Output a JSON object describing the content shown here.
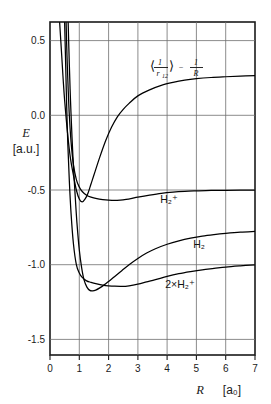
{
  "chart_data": {
    "type": "line",
    "title": "",
    "xlabel": "R",
    "xunit": "[a₀]",
    "ylabel": "E",
    "yunit": "[a.u.]",
    "xlim": [
      0,
      7
    ],
    "ylim": [
      -1.6,
      0.62
    ],
    "grid": true,
    "legend_position": "inline-labels",
    "xticks": [
      "0",
      "1",
      "2",
      "3",
      "4",
      "5",
      "6",
      "7"
    ],
    "xtick_values": [
      0,
      1,
      2,
      3,
      4,
      5,
      6,
      7
    ],
    "yticks": [
      "0.5",
      "0.0",
      "-0.5",
      "-1.0",
      "-1.5"
    ],
    "ytick_values": [
      0.5,
      0.0,
      -0.5,
      -1.0,
      -1.5
    ],
    "series": [
      {
        "name": "coulomb-repulsion",
        "label": "⟨1/r₁₂⟩ − 1/R",
        "label_x": 4.0,
        "label_y": 0.33,
        "points": [
          [
            0.33,
            0.62
          ],
          [
            0.4,
            0.4
          ],
          [
            0.45,
            0.24
          ],
          [
            0.5,
            0.1
          ],
          [
            0.6,
            -0.12
          ],
          [
            0.7,
            -0.29
          ],
          [
            0.8,
            -0.4
          ],
          [
            0.9,
            -0.5
          ],
          [
            1.0,
            -0.56
          ],
          [
            1.1,
            -0.58
          ],
          [
            1.2,
            -0.56
          ],
          [
            1.3,
            -0.52
          ],
          [
            1.4,
            -0.46
          ],
          [
            1.5,
            -0.4
          ],
          [
            1.7,
            -0.28
          ],
          [
            1.9,
            -0.17
          ],
          [
            2.1,
            -0.08
          ],
          [
            2.3,
            -0.01
          ],
          [
            2.5,
            0.04
          ],
          [
            2.7,
            0.08
          ],
          [
            3.0,
            0.13
          ],
          [
            3.4,
            0.17
          ],
          [
            3.8,
            0.2
          ],
          [
            4.2,
            0.22
          ],
          [
            4.6,
            0.235
          ],
          [
            5.0,
            0.245
          ],
          [
            5.5,
            0.253
          ],
          [
            6.0,
            0.258
          ],
          [
            6.5,
            0.262
          ],
          [
            7.0,
            0.265
          ]
        ]
      },
      {
        "name": "h2-plus",
        "label": "H₂⁺",
        "label_x": 4.4,
        "label_y": -0.63,
        "points": [
          [
            0.55,
            0.62
          ],
          [
            0.58,
            0.4
          ],
          [
            0.62,
            0.18
          ],
          [
            0.66,
            0.0
          ],
          [
            0.72,
            -0.18
          ],
          [
            0.8,
            -0.33
          ],
          [
            0.9,
            -0.43
          ],
          [
            1.0,
            -0.48
          ],
          [
            1.1,
            -0.51
          ],
          [
            1.25,
            -0.535
          ],
          [
            1.4,
            -0.548
          ],
          [
            1.6,
            -0.558
          ],
          [
            1.8,
            -0.564
          ],
          [
            2.0,
            -0.568
          ],
          [
            2.2,
            -0.57
          ],
          [
            2.4,
            -0.568
          ],
          [
            2.6,
            -0.563
          ],
          [
            2.8,
            -0.556
          ],
          [
            3.0,
            -0.548
          ],
          [
            3.4,
            -0.534
          ],
          [
            3.8,
            -0.522
          ],
          [
            4.2,
            -0.514
          ],
          [
            4.6,
            -0.509
          ],
          [
            5.0,
            -0.506
          ],
          [
            5.5,
            -0.503
          ],
          [
            6.0,
            -0.502
          ],
          [
            6.5,
            -0.501
          ],
          [
            7.0,
            -0.5
          ]
        ]
      },
      {
        "name": "h2",
        "label": "H₂",
        "label_x": 5.0,
        "label_y": -0.9,
        "points": [
          [
            0.62,
            0.62
          ],
          [
            0.66,
            0.34
          ],
          [
            0.7,
            0.1
          ],
          [
            0.75,
            -0.14
          ],
          [
            0.8,
            -0.34
          ],
          [
            0.86,
            -0.54
          ],
          [
            0.92,
            -0.72
          ],
          [
            1.0,
            -0.9
          ],
          [
            1.08,
            -1.02
          ],
          [
            1.16,
            -1.1
          ],
          [
            1.26,
            -1.15
          ],
          [
            1.36,
            -1.172
          ],
          [
            1.46,
            -1.175
          ],
          [
            1.56,
            -1.17
          ],
          [
            1.7,
            -1.155
          ],
          [
            1.85,
            -1.135
          ],
          [
            2.0,
            -1.112
          ],
          [
            2.2,
            -1.08
          ],
          [
            2.45,
            -1.04
          ],
          [
            2.7,
            -1.0
          ],
          [
            3.0,
            -0.958
          ],
          [
            3.3,
            -0.922
          ],
          [
            3.6,
            -0.893
          ],
          [
            4.0,
            -0.863
          ],
          [
            4.4,
            -0.84
          ],
          [
            4.8,
            -0.822
          ],
          [
            5.2,
            -0.808
          ],
          [
            5.6,
            -0.798
          ],
          [
            6.0,
            -0.79
          ],
          [
            6.5,
            -0.782
          ],
          [
            7.0,
            -0.777
          ]
        ]
      },
      {
        "name": "twice-h2-plus",
        "label": "2×H₂⁺",
        "label_x": 4.3,
        "label_y": -1.13,
        "points": [
          [
            0.5,
            0.62
          ],
          [
            0.54,
            0.3
          ],
          [
            0.57,
            0.06
          ],
          [
            0.61,
            -0.2
          ],
          [
            0.66,
            -0.44
          ],
          [
            0.72,
            -0.66
          ],
          [
            0.8,
            -0.86
          ],
          [
            0.9,
            -1.0
          ],
          [
            1.0,
            -1.055
          ],
          [
            1.1,
            -1.085
          ],
          [
            1.25,
            -1.108
          ],
          [
            1.4,
            -1.118
          ],
          [
            1.6,
            -1.128
          ],
          [
            1.8,
            -1.136
          ],
          [
            2.0,
            -1.141
          ],
          [
            2.2,
            -1.144
          ],
          [
            2.45,
            -1.145
          ],
          [
            2.7,
            -1.141
          ],
          [
            3.0,
            -1.13
          ],
          [
            3.3,
            -1.115
          ],
          [
            3.6,
            -1.1
          ],
          [
            4.0,
            -1.078
          ],
          [
            4.4,
            -1.06
          ],
          [
            4.8,
            -1.046
          ],
          [
            5.2,
            -1.034
          ],
          [
            5.6,
            -1.025
          ],
          [
            6.0,
            -1.016
          ],
          [
            6.5,
            -1.008
          ],
          [
            7.0,
            -1.001
          ]
        ]
      }
    ],
    "annotations": {
      "top_curve_expr": {
        "angle_open": "⟨",
        "numerator": "1",
        "denominator": "r",
        "denominator_sub": "12",
        "angle_close": "⟩",
        "minus": "−",
        "num2": "1",
        "den2": "R"
      }
    }
  }
}
